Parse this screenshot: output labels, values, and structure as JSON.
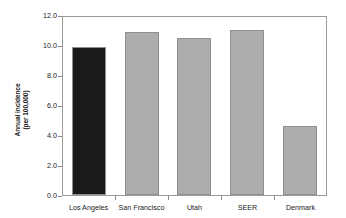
{
  "chart_data": {
    "type": "bar",
    "title": "",
    "xlabel": "",
    "ylabel": "Annual incidence (per 100,000)",
    "ylabel_lines": [
      "Annual incidence",
      "(per 100,000)"
    ],
    "categories": [
      "Los Angeles",
      "San Francisco",
      "Utah",
      "SEER",
      "Denmark"
    ],
    "values": [
      9.9,
      10.9,
      10.5,
      11.0,
      4.6
    ],
    "ylim": [
      0.0,
      12.0
    ],
    "ytick_labels": [
      "12.0",
      "10.0",
      "8.0",
      "6.0",
      "4.0",
      "2.0",
      "0.0"
    ],
    "ytick_values": [
      12.0,
      10.0,
      8.0,
      6.0,
      4.0,
      2.0,
      0.0
    ],
    "grid": false,
    "legend": "none",
    "bar_colors": [
      "#1a1a1a",
      "#adadad",
      "#adadad",
      "#adadad",
      "#adadad"
    ],
    "bar_border_color": "#8f8f8f",
    "highlight_category": "Los Angeles",
    "axis_color": "#9b9b9b",
    "background_color": "#ffffff"
  }
}
